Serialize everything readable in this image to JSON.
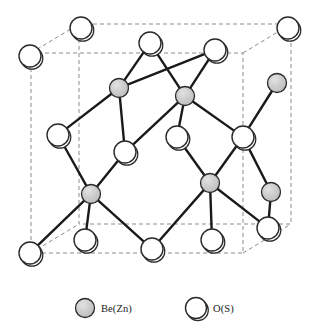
{
  "figure": {
    "kind": "crystal-structure-diagram",
    "background_color": "#ffffff",
    "bond_color": "#1a1a1a",
    "cell_edge_color": "#8c8c8c"
  },
  "legend": {
    "items": [
      {
        "id": "cation",
        "label": "Be(Zn)",
        "marker": "filled-gray-circle",
        "fill": "#c9c9c9",
        "stroke": "#2a2a2a",
        "radius": 9.5,
        "marker_cx": 85,
        "marker_cy": 308
      },
      {
        "id": "anion",
        "label": "O(S)",
        "marker": "open-white-circle",
        "fill": "#ffffff",
        "stroke": "#2a2a2a",
        "radius": 10.5,
        "marker_cx": 196,
        "marker_cy": 308
      }
    ],
    "label_positions": [
      {
        "x": 101,
        "y": 312
      },
      {
        "x": 213,
        "y": 312
      }
    ]
  },
  "structure": {
    "cell": {
      "front_face": {
        "x1": 31,
        "y1": 53,
        "x2": 243,
        "y2": 253
      },
      "back_face": {
        "x1": 79,
        "y1": 24,
        "x2": 291,
        "y2": 224
      },
      "stroke_dash": "4,3",
      "stroke_width": 1
    },
    "cation_radius": 9.5,
    "anion_radius": 11,
    "cations": [
      {
        "id": "c1",
        "cx": 119,
        "cy": 88
      },
      {
        "id": "c2",
        "cx": 185,
        "cy": 96
      },
      {
        "id": "c3",
        "cx": 91,
        "cy": 194
      },
      {
        "id": "c4",
        "cx": 210,
        "cy": 183
      },
      {
        "id": "c5",
        "cx": 277,
        "cy": 83
      },
      {
        "id": "c6",
        "cx": 271,
        "cy": 192
      }
    ],
    "anions": [
      {
        "id": "a1",
        "cx": 81,
        "cy": 28
      },
      {
        "id": "a2",
        "cx": 150,
        "cy": 43
      },
      {
        "id": "a3",
        "cx": 215,
        "cy": 50
      },
      {
        "id": "a4",
        "cx": 288,
        "cy": 28
      },
      {
        "id": "a5",
        "cx": 30,
        "cy": 56
      },
      {
        "id": "a6",
        "cx": 58,
        "cy": 135
      },
      {
        "id": "a7",
        "cx": 125,
        "cy": 152
      },
      {
        "id": "a8",
        "cx": 177,
        "cy": 137
      },
      {
        "id": "a9",
        "cx": 243,
        "cy": 137
      },
      {
        "id": "a10",
        "cx": 30,
        "cy": 253
      },
      {
        "id": "a11",
        "cx": 85,
        "cy": 240
      },
      {
        "id": "a12",
        "cx": 152,
        "cy": 249
      },
      {
        "id": "a13",
        "cx": 212,
        "cy": 240
      },
      {
        "id": "a14",
        "cx": 268,
        "cy": 228
      }
    ],
    "bonds": [
      {
        "from": "a2",
        "to": "c1"
      },
      {
        "from": "a3",
        "to": "c2"
      },
      {
        "from": "a2",
        "to": "c2"
      },
      {
        "from": "a3",
        "to": "c1"
      },
      {
        "from": "c1",
        "to": "a6"
      },
      {
        "from": "c1",
        "to": "a7"
      },
      {
        "from": "c2",
        "to": "a8"
      },
      {
        "from": "c2",
        "to": "a9"
      },
      {
        "from": "c2",
        "to": "a7"
      },
      {
        "from": "a6",
        "to": "c3"
      },
      {
        "from": "a7",
        "to": "c3"
      },
      {
        "from": "a8",
        "to": "c4"
      },
      {
        "from": "a9",
        "to": "c4"
      },
      {
        "from": "a9",
        "to": "c5"
      },
      {
        "from": "a9",
        "to": "c6"
      },
      {
        "from": "c3",
        "to": "a10"
      },
      {
        "from": "c3",
        "to": "a11"
      },
      {
        "from": "c3",
        "to": "a12"
      },
      {
        "from": "c4",
        "to": "a12"
      },
      {
        "from": "c4",
        "to": "a13"
      },
      {
        "from": "c4",
        "to": "a14"
      },
      {
        "from": "c6",
        "to": "a14"
      }
    ]
  }
}
